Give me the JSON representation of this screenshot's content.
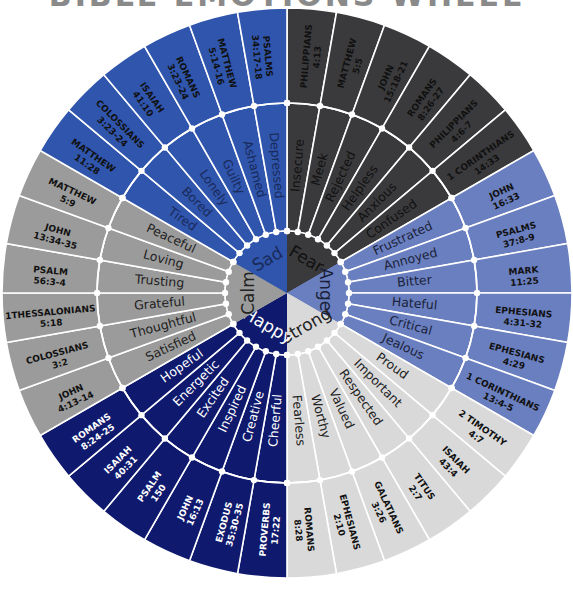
{
  "title": "BIBLE EMOTIONS WHEEL",
  "center": {
    "x": 287,
    "y": 293
  },
  "radii": {
    "hub": 62,
    "middle": 190,
    "outer": 285
  },
  "colors": {
    "divider": "#ffffff",
    "node": "#ffffff"
  },
  "sectors": [
    {
      "name": "Fear",
      "start_deg": 0,
      "end_deg": 60,
      "color": "#3a3a3c",
      "text_color": "#111111",
      "ref_color": "#111111",
      "emotions": [
        {
          "label": "Insecure",
          "reference": "PHILIPPIANS 4:13"
        },
        {
          "label": "Meek",
          "reference": "MATTHEW 5:5"
        },
        {
          "label": "Rejected",
          "reference": "JOHN 15:18-21"
        },
        {
          "label": "Helpless",
          "reference": "ROMANS 8:26-27"
        },
        {
          "label": "Anxious",
          "reference": "PHILIPPIANS 4:6-7"
        },
        {
          "label": "Confused",
          "reference": "1 CORINTHIANS 14:33"
        }
      ]
    },
    {
      "name": "Anger",
      "start_deg": 60,
      "end_deg": 120,
      "color": "#6a7fbf",
      "text_color": "#1a1f3a",
      "ref_color": "#111111",
      "emotions": [
        {
          "label": "Frustrated",
          "reference": "JOHN 16:33"
        },
        {
          "label": "Annoyed",
          "reference": "PSALMS 37:8-9"
        },
        {
          "label": "Bitter",
          "reference": "MARK 11:25"
        },
        {
          "label": "Hateful",
          "reference": "EPHESIANS 4:31-32"
        },
        {
          "label": "Critical",
          "reference": "EPHESIANS 4:29"
        },
        {
          "label": "Jealous",
          "reference": "1 CORINTHIANS 13:4-5"
        }
      ]
    },
    {
      "name": "Strong",
      "start_deg": 120,
      "end_deg": 180,
      "color": "#d9d9d9",
      "text_color": "#222222",
      "ref_color": "#111111",
      "emotions": [
        {
          "label": "Proud",
          "reference": "2 TIMOTHY 4:7"
        },
        {
          "label": "Important",
          "reference": "ISAIAH 43:4"
        },
        {
          "label": "Respected",
          "reference": "TITUS 2:7"
        },
        {
          "label": "Valued",
          "reference": "GALATIANS 3:26"
        },
        {
          "label": "Worthy",
          "reference": "EPHESIANS 2:10"
        },
        {
          "label": "Fearless",
          "reference": "ROMANS 8:28"
        }
      ]
    },
    {
      "name": "Happy",
      "start_deg": 180,
      "end_deg": 240,
      "color": "#0f1a6e",
      "text_color": "#ffffff",
      "ref_color": "#ffffff",
      "emotions": [
        {
          "label": "Cheerful",
          "reference": "PROVERBS 17:22"
        },
        {
          "label": "Creative",
          "reference": "EXODUS 35:30-35"
        },
        {
          "label": "Inspired",
          "reference": "JOHN 16:13"
        },
        {
          "label": "Excited",
          "reference": "PSALM 150"
        },
        {
          "label": "Energetic",
          "reference": "ISAIAH 40:31"
        },
        {
          "label": "Hopeful",
          "reference": "ROMANS 8:24-25"
        }
      ]
    },
    {
      "name": "Calm",
      "start_deg": 240,
      "end_deg": 300,
      "color": "#9b9b9b",
      "text_color": "#222222",
      "ref_color": "#111111",
      "emotions": [
        {
          "label": "Satisfied",
          "reference": "JOHN 4:13-14"
        },
        {
          "label": "Thoughtful",
          "reference": "COLOSSIANS 3:2"
        },
        {
          "label": "Grateful",
          "reference": "1THESSALONIANS 5:18"
        },
        {
          "label": "Trusting",
          "reference": "PSALM 56:3-4"
        },
        {
          "label": "Loving",
          "reference": "JOHN 13:34-35"
        },
        {
          "label": "Peaceful",
          "reference": "MATTHEW 5:9"
        }
      ]
    },
    {
      "name": "Sad",
      "start_deg": 300,
      "end_deg": 360,
      "color": "#2f55ad",
      "text_color": "#1a2a5a",
      "ref_color": "#111111",
      "emotions": [
        {
          "label": "Tired",
          "reference": "MATTHEW 11:28"
        },
        {
          "label": "Bored",
          "reference": "COLOSSIANS 3:23-24"
        },
        {
          "label": "Lonely",
          "reference": "ISAIAH 41:10"
        },
        {
          "label": "Guilty",
          "reference": "ROMANS 3:23-24"
        },
        {
          "label": "Ashamed",
          "reference": "MATTHEW 5:14-16"
        },
        {
          "label": "Depressed",
          "reference": "PSALMS 34:17-18"
        }
      ]
    }
  ]
}
